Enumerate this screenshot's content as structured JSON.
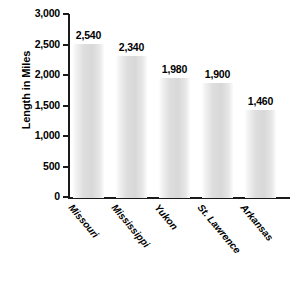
{
  "chart_data": {
    "type": "bar",
    "title": "",
    "subtitle": "",
    "xlabel": "",
    "ylabel": "Length in Miles",
    "categories": [
      "Missouri",
      "Mississippi",
      "Yukon",
      "St. Lawrence",
      "Arkansas"
    ],
    "values": [
      2540,
      2340,
      1980,
      1900,
      1460
    ],
    "value_labels": [
      "2,540",
      "2,340",
      "1,980",
      "1,900",
      "1,460"
    ],
    "ylim": [
      0,
      3000
    ],
    "ytick_values": [
      3000,
      2500,
      2000,
      1500,
      1000,
      500,
      0
    ],
    "ytick_labels": [
      "3,000",
      "2,500",
      "2,000",
      "1,500",
      "1,000",
      "500",
      "0"
    ],
    "grid": false,
    "legend": null,
    "legend_position": "none",
    "annotations": [],
    "series": [
      {
        "name": "Length in Miles",
        "values": [
          2540,
          2340,
          1980,
          1900,
          1460
        ]
      }
    ]
  },
  "colors": {
    "background": "#ffffff",
    "axis": "#1a1a1a",
    "bar_light": "#fdfdfd",
    "bar_mid": "#dedede",
    "bar_dark": "#d8d8d8",
    "text": "#000000"
  }
}
